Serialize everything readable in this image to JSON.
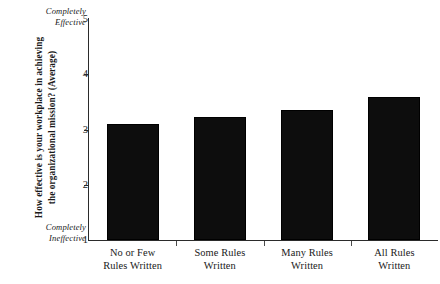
{
  "chart_data": {
    "type": "bar",
    "title": "",
    "xlabel": "",
    "ylabel": "How effective is your workplace in achieving the organizational mission? (Average)",
    "ylabel_line1": "How effective is your workplace in achieving",
    "ylabel_line2": "the organizational mission? (Average)",
    "categories": [
      "No or Few Rules Written",
      "Some Rules Written",
      "Many Rules Written",
      "All Rules Written"
    ],
    "category_lines": [
      [
        "No or Few",
        "Rules Written"
      ],
      [
        "Some Rules",
        "Written"
      ],
      [
        "Many Rules",
        "Written"
      ],
      [
        "All Rules",
        "Written"
      ]
    ],
    "values": [
      3.1,
      3.23,
      3.35,
      3.59
    ],
    "ylim": [
      1,
      5
    ],
    "yticks": [
      "5",
      "4",
      "3",
      "2",
      "1"
    ],
    "ytick_values": [
      5,
      4,
      3,
      2,
      1
    ],
    "grid": false,
    "legend": false,
    "bar_color": "#0d0d0d",
    "axis_color": "#2b2b2b",
    "background": "#ffffff",
    "scale_anchor_high_line1": "Completely",
    "scale_anchor_high_line2": "Effective",
    "scale_anchor_low_line1": "Completely",
    "scale_anchor_low_line2": "Ineffective"
  }
}
